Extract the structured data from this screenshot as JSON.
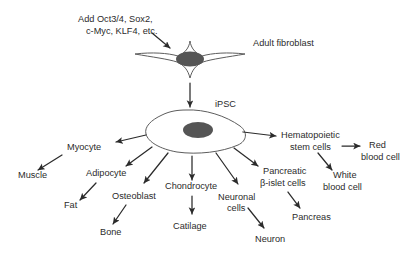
{
  "diagram": {
    "background_color": "#ffffff",
    "text_color": "#2b2b2b",
    "cell_outline_color": "#5d5d5d",
    "nucleus_color": "#555555"
  },
  "labels": {
    "reprogramming_factors_line1": "Add Oct3/4, Sox2,",
    "reprogramming_factors_line2": "c-Myc, KLF4, etc.",
    "adult_fibroblast": "Adult fibroblast",
    "ipsc": "iPSC",
    "myocyte": "Myocyte",
    "muscle": "Muscle",
    "adipocyte": "Adipocyte",
    "fat": "Fat",
    "osteoblast": "Osteoblast",
    "bone": "Bone",
    "chondrocyte": "Chondrocyte",
    "catilage": "Catilage",
    "neuronal_cells_line1": "Neuronal",
    "neuronal_cells_line2": "cells",
    "neuron": "Neuron",
    "pancreatic_line1": "Pancreatic",
    "pancreatic_line2": "β-islet cells",
    "pancreas": "Pancreas",
    "hematopoietic_line1": "Hematopoietic",
    "hematopoietic_line2": "stem cells",
    "red_blood_cell_line1": "Red",
    "red_blood_cell_line2": "blood cell",
    "white_blood_cell_line1": "White",
    "white_blood_cell_line2": "blood cell"
  },
  "cells": [
    {
      "name": "adult-fibroblast-cell",
      "shape": "spindle-star",
      "label": "Adult fibroblast"
    },
    {
      "name": "ipsc-cell",
      "shape": "irregular-blob",
      "label": "iPSC"
    }
  ],
  "flow": {
    "reprogramming_arrow": "factors-to-fibroblast",
    "induction_arrow": "fibroblast-to-ipsc",
    "lineages": [
      "Myocyte",
      "Adipocyte",
      "Osteoblast",
      "Chondrocyte",
      "Neuronal cells",
      "Pancreatic β-islet cells",
      "Hematopoietic stem cells"
    ],
    "terminal_tissues": [
      "Muscle",
      "Fat",
      "Bone",
      "Catilage",
      "Neuron",
      "Pancreas",
      "Red blood cell",
      "White blood cell"
    ]
  }
}
